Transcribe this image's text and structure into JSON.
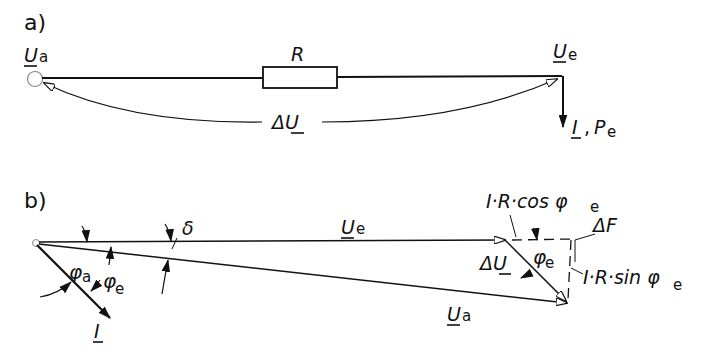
{
  "panels": {
    "a": {
      "label": "a)",
      "source_voltage": {
        "symbol": "U",
        "sub": "a"
      },
      "resistor": {
        "symbol": "R"
      },
      "end_voltage": {
        "symbol": "U",
        "sub": "e"
      },
      "voltage_drop": {
        "symbol": "ΔU"
      },
      "current_power": {
        "current": "I",
        "sep": ",",
        "power": "P",
        "power_sub": "e"
      }
    },
    "b": {
      "label": "b)",
      "angle_delta": "δ",
      "phi_a": {
        "symbol": "φ",
        "sub": "a"
      },
      "phi_e_left": {
        "symbol": "φ",
        "sub": "e"
      },
      "current": "I",
      "ue_vector": {
        "symbol": "U",
        "sub": "e"
      },
      "ua_vector": {
        "symbol": "U",
        "sub": "a"
      },
      "delta_u": "ΔU",
      "phi_e_right": {
        "symbol": "φ",
        "sub": "e"
      },
      "ir_cos": {
        "text": "I·R·cos φ",
        "sub": "e"
      },
      "ir_sin": {
        "text": "I·R·sin φ",
        "sub": "e"
      },
      "delta_f": "ΔF"
    }
  },
  "colors": {
    "ink": "#111111",
    "background": "#ffffff"
  }
}
